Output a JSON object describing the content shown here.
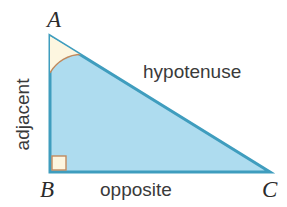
{
  "diagram": {
    "type": "right-triangle",
    "background_color": "#ffffff",
    "vertices": {
      "a": {
        "label": "A",
        "x": 50,
        "y": 36
      },
      "b": {
        "label": "B",
        "x": 50,
        "y": 172
      },
      "c": {
        "label": "C",
        "x": 270,
        "y": 172
      }
    },
    "sides": {
      "hypotenuse": {
        "label": "hypotenuse",
        "from": "A",
        "to": "C"
      },
      "opposite": {
        "label": "opposite",
        "from": "B",
        "to": "C"
      },
      "adjacent": {
        "label": "adjacent",
        "from": "A",
        "to": "B",
        "rotation_deg": -90
      }
    },
    "angles": {
      "at_a": {
        "marker": "arc",
        "radius": 37,
        "fill_color": "#fdf6e0",
        "stroke_color": "#c49a6c"
      },
      "at_b": {
        "marker": "right-angle-square",
        "size": 14,
        "fill_color": "#fdf6e0",
        "stroke_color": "#c49a6c"
      }
    },
    "colors": {
      "triangle_fill": "#aedcef",
      "triangle_stroke": "#3f9dbe",
      "text": "#3a3a3a",
      "vertex_text": "#2b2b2b"
    },
    "stroke_width": 3
  }
}
